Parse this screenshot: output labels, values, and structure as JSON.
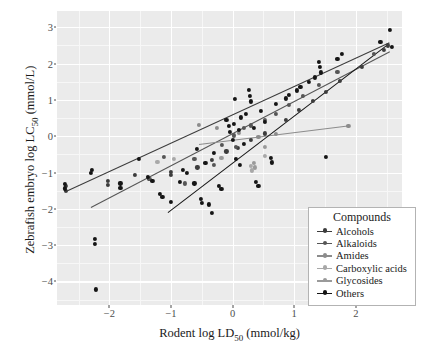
{
  "chart_data": {
    "type": "scatter",
    "title": "",
    "xlabel": "Rodent log LD50 (mmol/kg)",
    "ylabel": "Zebrafish embryo log LC50 (mmol/L)",
    "xlabel_parts": {
      "pre": "Rodent log LD",
      "sub": "50",
      "post": " (mmol/kg)"
    },
    "ylabel_parts": {
      "pre": "Zebrafish embryo log LC",
      "sub": "50",
      "post": " (mmol/L)"
    },
    "xlim": [
      -2.85,
      2.75
    ],
    "ylim": [
      -4.65,
      3.45
    ],
    "xticks": [
      -2,
      -1,
      0,
      1,
      2
    ],
    "yticks": [
      3,
      2,
      1,
      0,
      -1,
      -2,
      -3,
      -4
    ],
    "grid": true,
    "grid_color": "#ffffff",
    "panel_background": "#ebebeb",
    "legend_position": "bottom-right",
    "legend_title": "Compounds",
    "series": [
      {
        "name": "Alcohols",
        "color": "#3c3c3c",
        "fit": {
          "x0": -2.7,
          "y0": -1.52,
          "x1": 2.55,
          "y1": 2.58
        },
        "points": [
          {
            "x": -2.7,
            "y": -1.37
          },
          {
            "x": -2.7,
            "y": -1.5
          },
          {
            "x": -2.02,
            "y": -1.22
          },
          {
            "x": -2.02,
            "y": -1.35
          },
          {
            "x": -1.58,
            "y": -1.07
          },
          {
            "x": -1.36,
            "y": -1.18
          },
          {
            "x": -1.0,
            "y": -0.98
          },
          {
            "x": -1.0,
            "y": -1.06
          },
          {
            "x": -0.57,
            "y": -0.86
          },
          {
            "x": -0.33,
            "y": -0.66
          },
          {
            "x": -0.1,
            "y": -0.42
          },
          {
            "x": 0.08,
            "y": -0.33
          },
          {
            "x": 0.3,
            "y": -0.1
          },
          {
            "x": 0.52,
            "y": 0.08
          },
          {
            "x": 0.86,
            "y": 0.46
          },
          {
            "x": 1.08,
            "y": 0.72
          },
          {
            "x": 1.3,
            "y": 0.98
          },
          {
            "x": 1.52,
            "y": 1.22
          },
          {
            "x": 1.74,
            "y": 1.52
          },
          {
            "x": 2.1,
            "y": 1.92
          },
          {
            "x": 2.46,
            "y": 2.38
          },
          {
            "x": 2.52,
            "y": 2.5
          }
        ]
      },
      {
        "name": "Alkaloids",
        "color": "#555555",
        "fit": {
          "x0": -2.3,
          "y0": -1.95,
          "x1": 2.55,
          "y1": 2.34
        },
        "points": [
          {
            "x": -1.34,
            "y": -1.18
          },
          {
            "x": -1.12,
            "y": -0.58
          },
          {
            "x": -0.78,
            "y": -1.3
          },
          {
            "x": -0.62,
            "y": -0.62
          },
          {
            "x": -0.3,
            "y": -0.78
          },
          {
            "x": -0.17,
            "y": -0.24
          },
          {
            "x": 0.02,
            "y": 0.02
          },
          {
            "x": 0.06,
            "y": -0.3
          },
          {
            "x": 0.18,
            "y": 0.22
          },
          {
            "x": 0.3,
            "y": 0.3
          },
          {
            "x": 0.52,
            "y": 0.46
          },
          {
            "x": 0.7,
            "y": 0.62
          },
          {
            "x": 0.92,
            "y": 0.86
          },
          {
            "x": 1.14,
            "y": 1.12
          },
          {
            "x": 1.4,
            "y": 1.42
          },
          {
            "x": 1.7,
            "y": 1.78
          },
          {
            "x": 2.3,
            "y": 2.26
          }
        ]
      },
      {
        "name": "Amides",
        "color": "#8c8c8c",
        "fit": {
          "x0": -0.55,
          "y0": -0.22,
          "x1": 1.9,
          "y1": 0.3
        },
        "points": [
          {
            "x": -0.55,
            "y": 0.32
          },
          {
            "x": -0.26,
            "y": 0.22
          },
          {
            "x": 0.1,
            "y": 0.1
          },
          {
            "x": 0.42,
            "y": -0.02
          },
          {
            "x": 0.7,
            "y": 0.06
          },
          {
            "x": 1.88,
            "y": 0.28
          }
        ]
      },
      {
        "name": "Carboxylic acids",
        "color": "#a8a8a8",
        "fit": null,
        "points": [
          {
            "x": -1.22,
            "y": -0.7
          },
          {
            "x": -0.95,
            "y": -0.62
          },
          {
            "x": 0.3,
            "y": -0.82
          },
          {
            "x": 0.32,
            "y": -0.94
          },
          {
            "x": 0.52,
            "y": -0.54
          }
        ]
      },
      {
        "name": "Glycosides",
        "color": "#9a9a9a",
        "fit": null,
        "points": [
          {
            "x": -0.18,
            "y": -0.6
          },
          {
            "x": 0.34,
            "y": -0.74
          },
          {
            "x": 0.36,
            "y": -0.86
          },
          {
            "x": 0.52,
            "y": -0.3
          }
        ]
      },
      {
        "name": "Others",
        "color": "#151515",
        "fit": {
          "x0": -1.05,
          "y0": -2.08,
          "x1": 2.5,
          "y1": 2.52
        },
        "points": [
          {
            "x": -2.72,
            "y": -1.32
          },
          {
            "x": -2.72,
            "y": -1.44
          },
          {
            "x": -2.28,
            "y": -0.92
          },
          {
            "x": -2.3,
            "y": -1.02
          },
          {
            "x": -2.24,
            "y": -2.82
          },
          {
            "x": -2.24,
            "y": -2.96
          },
          {
            "x": -2.22,
            "y": -4.22
          },
          {
            "x": -1.82,
            "y": -1.3
          },
          {
            "x": -1.82,
            "y": -1.42
          },
          {
            "x": -1.52,
            "y": -0.62
          },
          {
            "x": -1.38,
            "y": -1.12
          },
          {
            "x": -1.3,
            "y": -1.22
          },
          {
            "x": -1.18,
            "y": -1.58
          },
          {
            "x": -1.14,
            "y": -1.68
          },
          {
            "x": -1.0,
            "y": -1.82
          },
          {
            "x": -0.86,
            "y": -1.26
          },
          {
            "x": -0.8,
            "y": -0.92
          },
          {
            "x": -0.74,
            "y": -1.02
          },
          {
            "x": -0.62,
            "y": -1.3
          },
          {
            "x": -0.58,
            "y": -0.34
          },
          {
            "x": -0.52,
            "y": -1.72
          },
          {
            "x": -0.5,
            "y": -1.84
          },
          {
            "x": -0.44,
            "y": -0.74
          },
          {
            "x": -0.38,
            "y": -1.88
          },
          {
            "x": -0.34,
            "y": -2.12
          },
          {
            "x": -0.3,
            "y": -0.46
          },
          {
            "x": -0.22,
            "y": -1.38
          },
          {
            "x": -0.18,
            "y": -1.46
          },
          {
            "x": -0.1,
            "y": 0.46
          },
          {
            "x": -0.06,
            "y": 0.28
          },
          {
            "x": -0.04,
            "y": 0.12
          },
          {
            "x": 0.0,
            "y": -0.1
          },
          {
            "x": 0.02,
            "y": 0.34
          },
          {
            "x": 0.04,
            "y": 1.02
          },
          {
            "x": 0.06,
            "y": -0.62
          },
          {
            "x": 0.1,
            "y": 0.18
          },
          {
            "x": 0.12,
            "y": -0.78
          },
          {
            "x": 0.14,
            "y": 0.52
          },
          {
            "x": 0.18,
            "y": -0.22
          },
          {
            "x": 0.22,
            "y": 0.62
          },
          {
            "x": 0.26,
            "y": 1.28
          },
          {
            "x": 0.28,
            "y": 1.12
          },
          {
            "x": 0.3,
            "y": 0.96
          },
          {
            "x": 0.34,
            "y": 0.24
          },
          {
            "x": 0.38,
            "y": -1.26
          },
          {
            "x": 0.42,
            "y": -1.38
          },
          {
            "x": 0.46,
            "y": 0.7
          },
          {
            "x": 0.52,
            "y": 0.4
          },
          {
            "x": 0.62,
            "y": -0.6
          },
          {
            "x": 0.64,
            "y": -0.72
          },
          {
            "x": 0.7,
            "y": 0.88
          },
          {
            "x": 0.86,
            "y": 1.04
          },
          {
            "x": 0.92,
            "y": 1.14
          },
          {
            "x": 1.04,
            "y": 1.26
          },
          {
            "x": 1.1,
            "y": 1.36
          },
          {
            "x": 1.24,
            "y": 1.5
          },
          {
            "x": 1.34,
            "y": 1.62
          },
          {
            "x": 1.4,
            "y": 2.04
          },
          {
            "x": 1.42,
            "y": 1.92
          },
          {
            "x": 1.44,
            "y": 1.76
          },
          {
            "x": 1.52,
            "y": -0.58
          },
          {
            "x": 1.7,
            "y": 2.12
          },
          {
            "x": 1.78,
            "y": 2.26
          },
          {
            "x": 2.4,
            "y": 2.6
          },
          {
            "x": 2.56,
            "y": 2.94
          },
          {
            "x": 2.58,
            "y": 2.46
          }
        ]
      }
    ]
  },
  "legend": {
    "title": "Compounds",
    "entries": [
      {
        "label": "Alcohols",
        "color": "#3c3c3c"
      },
      {
        "label": "Alkaloids",
        "color": "#555555"
      },
      {
        "label": "Amides",
        "color": "#8c8c8c"
      },
      {
        "label": "Carboxylic acids",
        "color": "#a8a8a8"
      },
      {
        "label": "Glycosides",
        "color": "#9a9a9a"
      },
      {
        "label": "Others",
        "color": "#151515"
      }
    ]
  },
  "axes": {
    "x_ticklabels": [
      "-2",
      "-1",
      "0",
      "1",
      "2"
    ],
    "y_ticklabels": [
      "3",
      "2",
      "1",
      "0",
      "-1",
      "-2",
      "-3",
      "-4"
    ]
  }
}
